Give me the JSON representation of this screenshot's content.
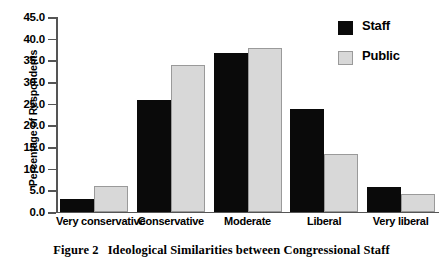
{
  "figure": {
    "caption_label": "Figure 2",
    "caption_text": "Ideological Similarities between Congressional Staff"
  },
  "legend": {
    "position": "top-right",
    "entries": [
      {
        "label": "Staff",
        "color": "#0a0a0a",
        "swatch_name": "legend-swatch-staff"
      },
      {
        "label": "Public",
        "color": "#d8d8d8",
        "swatch_name": "legend-swatch-public"
      }
    ]
  },
  "axes": {
    "y_title": "Percentage of Respondents",
    "y_ticks": [
      "45.0",
      "40.0",
      "35.0",
      "30.0",
      "25.0",
      "20.0",
      "15.0",
      "10.0",
      "5.0",
      "0.0"
    ],
    "x_ticks": [
      "Very conservative",
      "Conservative",
      "Moderate",
      "Liberal",
      "Very liberal"
    ]
  },
  "chart_data": {
    "type": "bar",
    "title": "Ideological Similarities between Congressional Staff",
    "categories": [
      "Very conservative",
      "Conservative",
      "Moderate",
      "Liberal",
      "Very liberal"
    ],
    "series": [
      {
        "name": "Staff",
        "color": "#0a0a0a",
        "values": [
          3.0,
          25.8,
          36.8,
          23.8,
          5.7
        ]
      },
      {
        "name": "Public",
        "color": "#d8d8d8",
        "values": [
          6.0,
          33.9,
          37.8,
          13.5,
          4.2
        ]
      }
    ],
    "xlabel": "",
    "ylabel": "Percentage of Respondents",
    "ylim": [
      0.0,
      45.0
    ],
    "ytick_step": 5.0,
    "grid": false,
    "legend_position": "top-right"
  }
}
